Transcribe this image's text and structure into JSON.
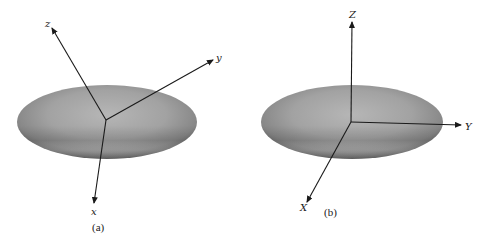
{
  "panels": [
    {
      "id": "a",
      "caption": "(a)",
      "ellipsoid": {
        "cx": 107,
        "cy": 122,
        "rx": 90,
        "ry": 37
      },
      "origin": {
        "x": 106,
        "y": 120
      },
      "axes": [
        {
          "name": "z",
          "label": "z",
          "end": {
            "x": 52,
            "y": 28
          },
          "label_pos": {
            "x": 45,
            "y": 27
          }
        },
        {
          "name": "y",
          "label": "y",
          "end": {
            "x": 213,
            "y": 60
          },
          "label_pos": {
            "x": 216,
            "y": 61
          }
        },
        {
          "name": "x",
          "label": "x",
          "end": {
            "x": 94,
            "y": 203
          },
          "label_pos": {
            "x": 91,
            "y": 215
          }
        }
      ],
      "caption_pos": {
        "x": 92,
        "y": 231
      }
    },
    {
      "id": "b",
      "caption": "(b)",
      "ellipsoid": {
        "cx": 352,
        "cy": 122,
        "rx": 91,
        "ry": 37
      },
      "origin": {
        "x": 351,
        "y": 122
      },
      "axes": [
        {
          "name": "Z",
          "label": "Z",
          "end": {
            "x": 352,
            "y": 22
          },
          "label_pos": {
            "x": 349,
            "y": 18
          }
        },
        {
          "name": "Y",
          "label": "Y",
          "end": {
            "x": 461,
            "y": 125
          },
          "label_pos": {
            "x": 465,
            "y": 130
          }
        },
        {
          "name": "X",
          "label": "X",
          "end": {
            "x": 307,
            "y": 202
          },
          "label_pos": {
            "x": 300,
            "y": 211
          }
        }
      ],
      "caption_pos": {
        "x": 324,
        "y": 216
      }
    }
  ],
  "colors": {
    "ellipsoid_light": "#b4b4b4",
    "ellipsoid_mid": "#9a9a9a",
    "ellipsoid_dark": "#6e6e6e",
    "axis": "#1a1a1a"
  }
}
